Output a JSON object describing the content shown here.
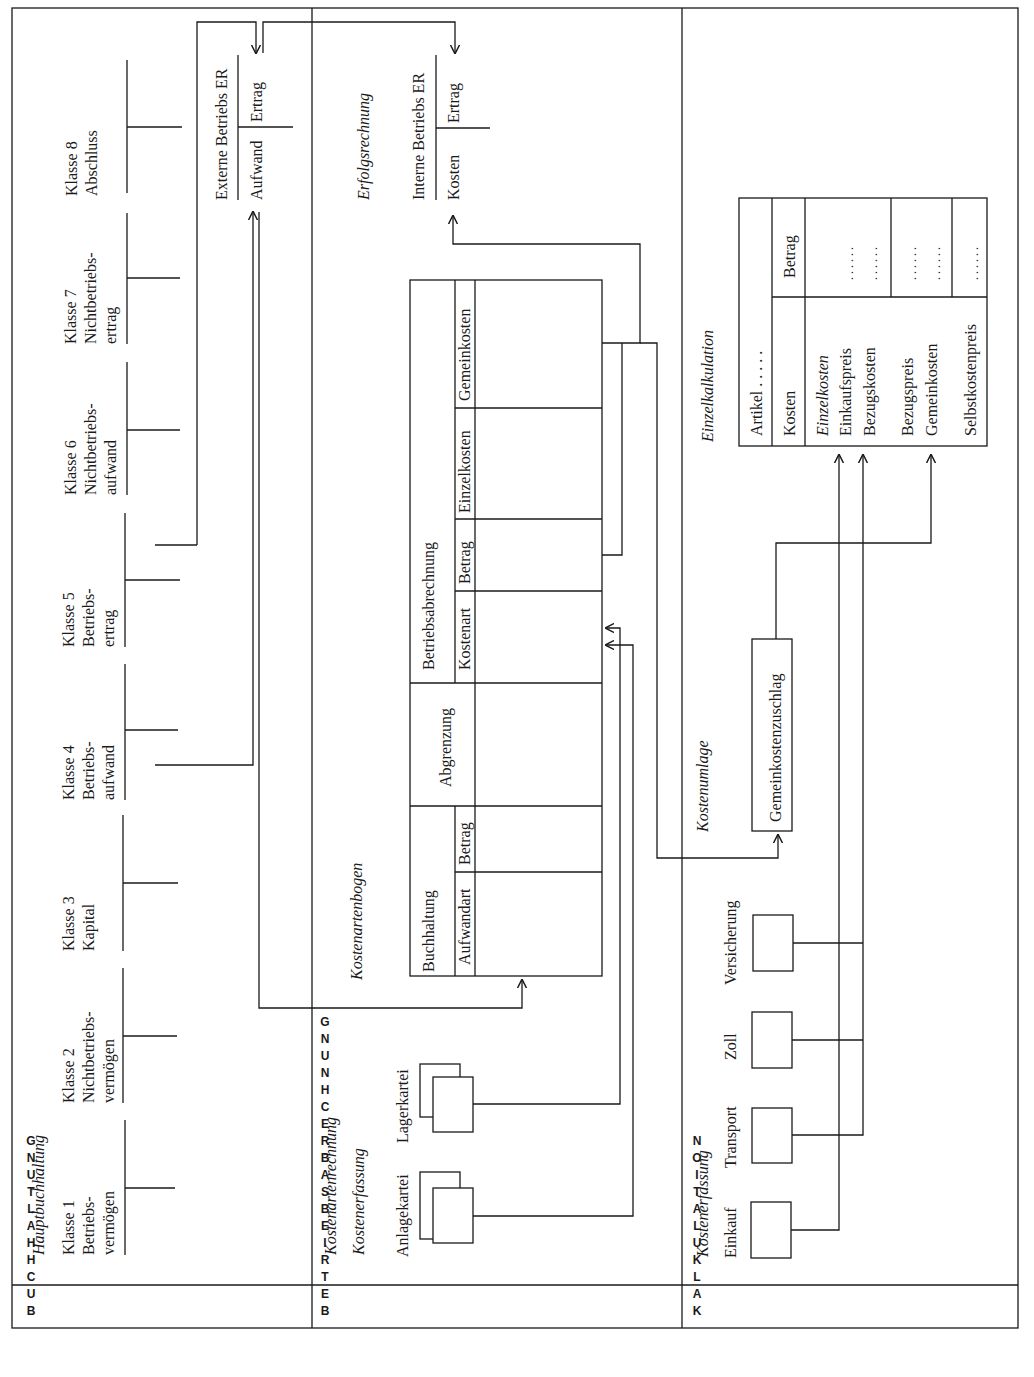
{
  "sections": {
    "buchhaltung": {
      "side_label": "BUCHHALTUNG",
      "title": "Hauptbuchhaltung",
      "classes": [
        {
          "line1": "Klasse 1",
          "line2": "Betriebs-",
          "line3": "vermögen"
        },
        {
          "line1": "Klasse 2",
          "line2": "Nichtbetriebs-",
          "line3": "vermögen"
        },
        {
          "line1": "Klasse 3",
          "line2": "Kapital",
          "line3": ""
        },
        {
          "line1": "Klasse 4",
          "line2": "Betriebs-",
          "line3": "aufwand"
        },
        {
          "line1": "Klasse 5",
          "line2": "Betriebs-",
          "line3": "ertrag"
        },
        {
          "line1": "Klasse 6",
          "line2": "Nichtbetriebs-",
          "line3": "aufwand"
        },
        {
          "line1": "Klasse 7",
          "line2": "Nichtbetriebs-",
          "line3": "ertrag"
        },
        {
          "line1": "Klasse 8",
          "line2": "Abschluss",
          "line3": ""
        }
      ],
      "externe_er": {
        "title": "Externe Betriebs ER",
        "left": "Aufwand",
        "right": "Ertrag"
      }
    },
    "betriebsabrechnung": {
      "side_label": "BETRIEBSABRECHNUNG",
      "title1": "Kostenartenrechnung",
      "title2": "Kostenerfassung",
      "kostenartenbogen_label": "Kostenartenbogen",
      "erfolgsrechnung_label": "Erfolgsrechnung",
      "karteien": [
        "Anlagekartei",
        "Lagerkartei"
      ],
      "table": {
        "buchhaltung": {
          "header": "Buchhaltung",
          "cols": [
            "Aufwandart",
            "Betrag"
          ]
        },
        "abgrenzung": {
          "header": "Abgrenzung"
        },
        "betriebsabrechnung": {
          "header": "Betriebsabrechnung",
          "cols": [
            "Kostenart",
            "Betrag",
            "Einzelkosten",
            "Gemeinkosten"
          ]
        }
      },
      "interne_er": {
        "title": "Interne Betriebs ER",
        "left": "Kosten",
        "right": "Ertrag"
      }
    },
    "kalkulation": {
      "side_label": "KALKULATION",
      "kostenerfassung_label": "Kostenerfassung",
      "sources": [
        "Einkauf",
        "Transport",
        "Zoll",
        "Versicherung"
      ],
      "kostenumlage_label": "Kostenumlage",
      "gemeinkostenzuschlag": "Gemeinkostenzuschlag",
      "einzelkalkulation_label": "Einzelkalkulation",
      "einzelkalk_table": {
        "artikel": "Artikel . . . . .",
        "kosten_header": "Kosten",
        "betrag_header": "Betrag",
        "group1": [
          "Einzelkosten",
          "Einkaufspreis",
          "Bezugskosten"
        ],
        "group2": [
          "Bezugspreis",
          "Gemeinkosten"
        ],
        "group3": [
          "Selbstkostenpreis"
        ],
        "dots": ". . . . . ."
      }
    }
  }
}
